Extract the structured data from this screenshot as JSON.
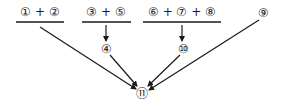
{
  "diagram": {
    "groups": [
      {
        "id": "group-a",
        "label": "① + ②"
      },
      {
        "id": "group-b",
        "label": "③ + ⑤"
      },
      {
        "id": "group-c",
        "label": "⑥ + ⑦ + ⑧"
      }
    ],
    "nodes": {
      "n4": "④",
      "n9": "⑨",
      "n10": "⑩",
      "n11": "⑪"
    },
    "edges": [
      {
        "from": "① + ②",
        "to": "⑪"
      },
      {
        "from": "③ + ⑤",
        "to": "④"
      },
      {
        "from": "④",
        "to": "⑪"
      },
      {
        "from": "⑥ + ⑦ + ⑧",
        "to": "⑩"
      },
      {
        "from": "⑩",
        "to": "⑪"
      },
      {
        "from": "⑨",
        "to": "⑪"
      }
    ],
    "line_color": "#1a1a1a"
  }
}
